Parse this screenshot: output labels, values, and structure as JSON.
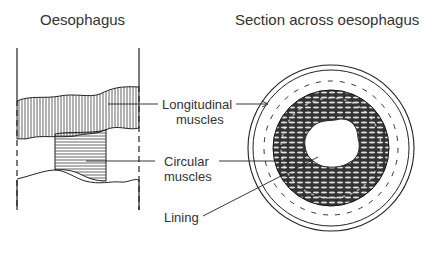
{
  "titles": {
    "left": "Oesophagus",
    "right": "Section across oesophagus"
  },
  "labels": {
    "longitudinal_line1": "Longitudinal",
    "longitudinal_line2": "muscles",
    "circular_line1": "Circular",
    "circular_line2": "muscles",
    "lining": "Lining"
  },
  "colors": {
    "ink": "#222222",
    "background": "#ffffff"
  }
}
